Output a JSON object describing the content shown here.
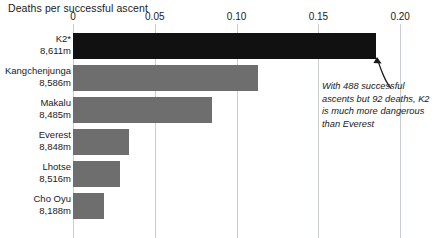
{
  "chart_data": {
    "type": "bar",
    "orientation": "horizontal",
    "title": "Deaths per successful ascent",
    "xlabel": "",
    "ylabel": "",
    "xlim": [
      0,
      0.2
    ],
    "grid": true,
    "legend": false,
    "xticks": [
      "0",
      "0.05",
      "0.10",
      "0.15",
      "0.20"
    ],
    "xtick_values": [
      0,
      0.05,
      0.1,
      0.15,
      0.2
    ],
    "categories": [
      "K2*",
      "Kangchenjunga",
      "Makalu",
      "Everest",
      "Lhotse",
      "Cho Oyu"
    ],
    "elevations": [
      "8,611m",
      "8,586m",
      "8,485m",
      "8,848m",
      "8,516m",
      "8,188m"
    ],
    "values": [
      0.185,
      0.113,
      0.085,
      0.034,
      0.029,
      0.019
    ],
    "bars": [
      {
        "name": "K2*",
        "elevation": "8,611m",
        "value": 0.185,
        "color": "#111111",
        "highlight": true
      },
      {
        "name": "Kangchenjunga",
        "elevation": "8,586m",
        "value": 0.113,
        "color": "#6e6e6e",
        "highlight": false
      },
      {
        "name": "Makalu",
        "elevation": "8,485m",
        "value": 0.085,
        "color": "#6e6e6e",
        "highlight": false
      },
      {
        "name": "Everest",
        "elevation": "8,848m",
        "value": 0.034,
        "color": "#6e6e6e",
        "highlight": false
      },
      {
        "name": "Lhotse",
        "elevation": "8,516m",
        "value": 0.029,
        "color": "#6e6e6e",
        "highlight": false
      },
      {
        "name": "Cho Oyu",
        "elevation": "8,188m",
        "value": 0.019,
        "color": "#6e6e6e",
        "highlight": false
      }
    ],
    "annotation": "With 488 successful ascents but 92 deaths, K2 is much more dangerous than Everest"
  },
  "colors": {
    "bar": "#6e6e6e",
    "highlight_bar": "#111111",
    "gridline": "#c9ccd1",
    "text": "#1a1a1a",
    "background": "#ffffff"
  }
}
